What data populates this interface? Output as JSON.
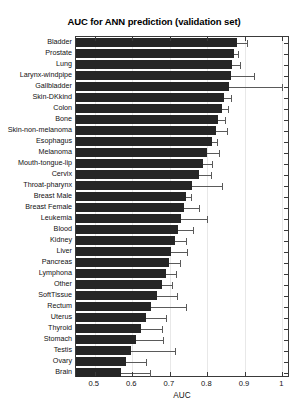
{
  "chart_data": {
    "type": "bar",
    "orientation": "horizontal",
    "title": "AUC for ANN prediction (validation set)",
    "xlabel": "AUC",
    "ylabel": "",
    "xlim": [
      0.45,
      1.02
    ],
    "grid": false,
    "legend": null,
    "xticks": [
      0.5,
      0.6,
      0.7,
      0.8,
      0.9,
      1
    ],
    "xticklabels": [
      "0.5",
      "0.6",
      "0.7",
      "0.8",
      "0.9",
      "1"
    ],
    "categories": [
      "Bladder",
      "Prostate",
      "Lung",
      "Larynx-windpipe",
      "Gallbladder",
      "Skin-DKkind",
      "Colon",
      "Bone",
      "Skin-non-melanoma",
      "Esophagus",
      "Melanoma",
      "Mouth-tongue-lip",
      "Cervix",
      "Throat-pharynx",
      "Breast Male",
      "Breast Female",
      "Leukemia",
      "Blood",
      "Kidney",
      "Liver",
      "Pancreas",
      "Lymphona",
      "Other",
      "SoftTissue",
      "Rectum",
      "Uterus",
      "Thyroid",
      "Stomach",
      "Testis",
      "Ovary",
      "Brain"
    ],
    "values": [
      0.878,
      0.872,
      0.866,
      0.862,
      0.858,
      0.845,
      0.838,
      0.829,
      0.822,
      0.812,
      0.8,
      0.789,
      0.778,
      0.76,
      0.744,
      0.737,
      0.731,
      0.723,
      0.713,
      0.704,
      0.697,
      0.69,
      0.68,
      0.665,
      0.65,
      0.636,
      0.623,
      0.61,
      0.596,
      0.582,
      0.57
    ],
    "errors_upper": [
      0.905,
      0.881,
      0.886,
      0.925,
      1.0,
      0.862,
      0.856,
      0.848,
      0.852,
      0.826,
      0.83,
      0.813,
      0.81,
      0.838,
      0.756,
      0.778,
      0.8,
      0.762,
      0.742,
      0.745,
      0.726,
      0.716,
      0.706,
      0.718,
      0.744,
      0.69,
      0.68,
      0.682,
      0.713,
      0.636,
      0.647
    ],
    "bar_color": "#262626",
    "error_color": "#5a5a5a"
  },
  "axes": {
    "x_axis_label": "AUC"
  }
}
